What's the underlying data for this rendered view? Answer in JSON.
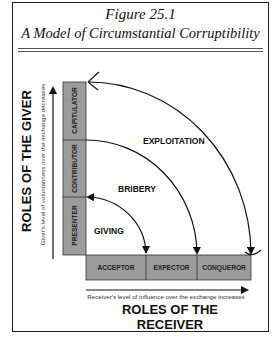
{
  "figure": {
    "number_label": "Figure 25.1",
    "title": "A Model of Circumstantial Corruptibility"
  },
  "y_axis": {
    "title": "ROLES OF THE GIVER",
    "subtitle": "Giver's level of voluntariness over the exchange decreases",
    "roles_bottom_to_top": [
      "PRESENTER",
      "CONTRIBUTOR",
      "CAPITULATOR"
    ]
  },
  "x_axis": {
    "title": "ROLES OF THE RECEIVER",
    "subtitle": "Receiver's level of influence over the exchange increases",
    "roles_left_to_right": [
      "ACCEPTOR",
      "EXPECTOR",
      "CONQUEROR"
    ]
  },
  "arcs": [
    {
      "label": "GIVING",
      "from": "PRESENTER",
      "to": "ACCEPTOR"
    },
    {
      "label": "BRIBERY",
      "from": "CONTRIBUTOR",
      "to": "EXPECTOR"
    },
    {
      "label": "EXPLOITATION",
      "from": "CAPITULATOR",
      "to": "CONQUEROR"
    }
  ],
  "colors": {
    "cell_fill": "#9c9c9c",
    "stroke": "#111111"
  }
}
